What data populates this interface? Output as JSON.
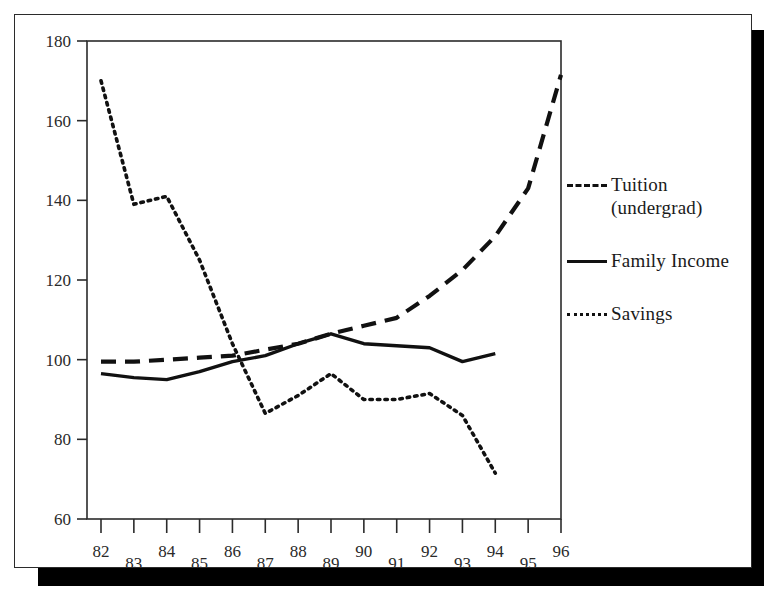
{
  "chart_data": {
    "type": "line",
    "title": "",
    "xlabel": "",
    "ylabel": "",
    "x": [
      82,
      83,
      84,
      85,
      86,
      87,
      88,
      89,
      90,
      91,
      92,
      93,
      94,
      95,
      96
    ],
    "x_tick_labels": [
      "82",
      "83",
      "84",
      "85",
      "86",
      "87",
      "88",
      "89",
      "90",
      "91",
      "92",
      "93",
      "94",
      "95",
      "96"
    ],
    "y_tick_labels": [
      "180",
      "160",
      "140",
      "120",
      "100",
      "80",
      "60"
    ],
    "y_ticks": [
      180,
      160,
      140,
      120,
      100,
      80,
      60
    ],
    "ylim": [
      60,
      180
    ],
    "xlim": [
      82,
      96
    ],
    "grid": false,
    "legend_position": "right",
    "series": [
      {
        "name": "Tuition (undergrad)",
        "style": "dashed",
        "color": "#111111",
        "x": [
          82,
          83,
          84,
          85,
          86,
          87,
          88,
          89,
          90,
          91,
          92,
          93,
          94,
          95,
          96
        ],
        "values": [
          99.5,
          99.5,
          100,
          100.5,
          101,
          102.5,
          104,
          106.5,
          108.5,
          110.5,
          116,
          122.5,
          131,
          143,
          171.5
        ]
      },
      {
        "name": "Family Income",
        "style": "solid",
        "color": "#111111",
        "x": [
          82,
          83,
          84,
          85,
          86,
          87,
          88,
          89,
          90,
          91,
          92,
          93,
          94
        ],
        "values": [
          96.5,
          95.5,
          95,
          97,
          99.5,
          101,
          104,
          106.5,
          104,
          103.5,
          103,
          99.5,
          101.5
        ]
      },
      {
        "name": "Savings",
        "style": "dotted",
        "color": "#111111",
        "x": [
          82,
          83,
          84,
          85,
          86,
          87,
          88,
          89,
          90,
          91,
          92,
          93,
          94
        ],
        "values": [
          170,
          139,
          141,
          125,
          104,
          86.5,
          91,
          96.5,
          90,
          90,
          91.5,
          86,
          71.5
        ]
      }
    ]
  },
  "legend": {
    "items": [
      {
        "label_line1": "Tuition",
        "label_line2": "(undergrad)",
        "style": "dashed",
        "key": "dashed-line-key"
      },
      {
        "label_line1": "Family Income",
        "label_line2": "",
        "style": "solid",
        "key": "solid-line-key"
      },
      {
        "label_line1": "Savings",
        "label_line2": "",
        "style": "dotted",
        "key": "dotted-line-key"
      }
    ]
  }
}
